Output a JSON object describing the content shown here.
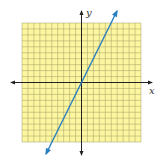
{
  "chart_data": {
    "type": "line",
    "title": "",
    "xlabel": "x",
    "ylabel": "y",
    "xlim": [
      -10,
      10
    ],
    "ylim": [
      -10,
      10
    ],
    "grid": true,
    "grid_step": 1,
    "series": [
      {
        "name": "y = 2x",
        "equation": "y = 2x",
        "slope": 2,
        "intercept": 0,
        "x": [
          -6,
          -5,
          0,
          5,
          6
        ],
        "y": [
          -12,
          -10,
          0,
          10,
          12
        ],
        "color": "#2a7fc1",
        "arrows": "both"
      }
    ]
  },
  "colors": {
    "grid_fill": "#fdf6a0",
    "grid_line": "#8a8a5a",
    "axis": "#222222",
    "line": "#2a7fc1"
  },
  "labels": {
    "x_axis": "x",
    "y_axis": "y"
  }
}
